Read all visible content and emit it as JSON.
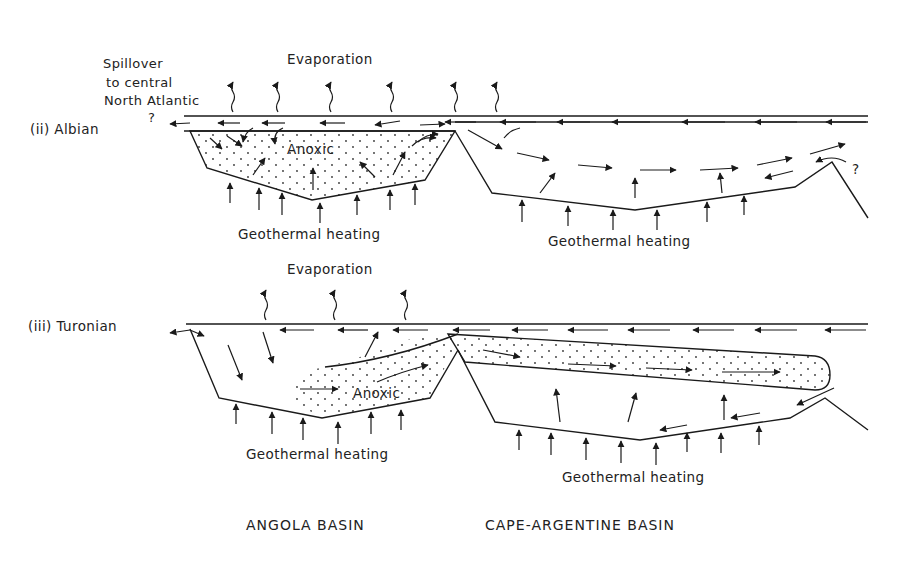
{
  "panels": [
    {
      "id": "albian",
      "label": "(ii) Albian",
      "evaporation_label": "Evaporation",
      "spillover_label_lines": [
        "Spillover",
        "to central",
        "North Atlantic"
      ],
      "spillover_question": "?",
      "anoxic_label": "Anoxic",
      "heating_left_label": "Geothermal heating",
      "heating_right_label": "Geothermal heating",
      "right_question": "?"
    },
    {
      "id": "turonian",
      "label": "(iii) Turonian",
      "evaporation_label": "Evaporation",
      "anoxic_label": "Anoxic",
      "heating_left_label": "Geothermal heating",
      "heating_right_label": "Geothermal heating"
    }
  ],
  "basins": {
    "left": "ANGOLA BASIN",
    "right": "CAPE-ARGENTINE BASIN"
  },
  "colors": {
    "ink": "#1a1a1a",
    "background": "#ffffff"
  }
}
